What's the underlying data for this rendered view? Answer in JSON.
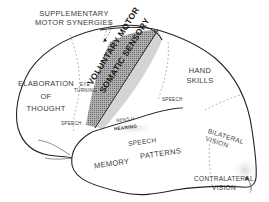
{
  "diagram": {
    "type": "brain-lateral-view-functional-areas",
    "colors": {
      "outline": "#2a2a2a",
      "text": "#3a3a3a",
      "motor_strip": "#9a9a9a",
      "sensory_strip": "#d8d8d8",
      "dashed": "#888888",
      "shade": "#e6e6e6"
    },
    "labels": {
      "supplementary_line1": "SUPPLEMENTARY",
      "supplementary_line2": "MOTOR SYNERGIES",
      "elaboration_line1": "ELABORATION",
      "elaboration_line2": "OF",
      "elaboration_line3": "THOUGHT",
      "eye_line1": "EYE",
      "eye_line2": "TURNING",
      "voluntary_motor": "VOLUNTARY MOTOR",
      "somatic_sensory": "SOMATIC SENSORY",
      "hand_line1": "HAND",
      "hand_line2": "SKILLS",
      "speech_frontal": "SPEECH",
      "speech_parietal": "SPEECH",
      "speech_temporal": "SPEECH",
      "sens_ii": "SENS II",
      "hearing": "HEARING",
      "memory": "MEMORY",
      "patterns": "PATTERNS",
      "bilateral_line1": "BILATERAL",
      "bilateral_line2": "VISION",
      "contralateral_line1": "CONTRALATERAL",
      "contralateral_line2": "VISION"
    }
  }
}
